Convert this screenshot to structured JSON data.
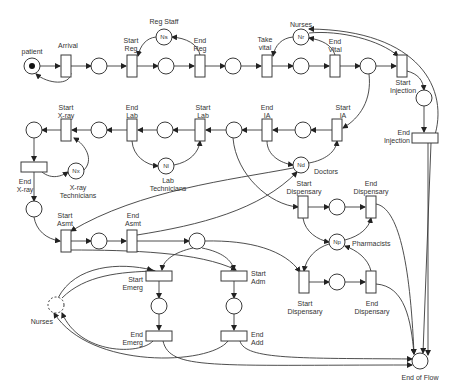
{
  "diagram": {
    "type": "petri-net",
    "places": [
      {
        "id": "patient",
        "label": "patient",
        "x": 32,
        "y": 66,
        "token": true
      },
      {
        "id": "p1",
        "label": "",
        "x": 99,
        "y": 66
      },
      {
        "id": "reg_staff",
        "label": "Reg Staff",
        "inner": "Ns",
        "x": 164,
        "y": 37
      },
      {
        "id": "p2",
        "label": "",
        "x": 166,
        "y": 66
      },
      {
        "id": "p3",
        "label": "",
        "x": 233,
        "y": 66
      },
      {
        "id": "nurses_top",
        "label": "Nurses",
        "inner": "Nr",
        "x": 301,
        "y": 37
      },
      {
        "id": "p4",
        "label": "",
        "x": 301,
        "y": 66
      },
      {
        "id": "p5",
        "label": "",
        "x": 368,
        "y": 66
      },
      {
        "id": "p6",
        "label": "",
        "x": 424,
        "y": 98
      },
      {
        "id": "p_ia",
        "label": "",
        "x": 303,
        "y": 130
      },
      {
        "id": "p_lab1",
        "label": "",
        "x": 234,
        "y": 130
      },
      {
        "id": "p_lab2",
        "label": "",
        "x": 165,
        "y": 130
      },
      {
        "id": "p_x1",
        "label": "",
        "x": 99,
        "y": 130
      },
      {
        "id": "p_x0",
        "label": "",
        "x": 34,
        "y": 130
      },
      {
        "id": "xray_tech",
        "label": "X-ray Technicians",
        "inner": "Nx",
        "x": 76,
        "y": 171
      },
      {
        "id": "lab_tech",
        "label": "Lab Technicians",
        "inner": "Nl",
        "x": 166,
        "y": 166
      },
      {
        "id": "doctors",
        "label": "Doctors",
        "inner": "Nd",
        "x": 301,
        "y": 165
      },
      {
        "id": "p_asm0",
        "label": "",
        "x": 34,
        "y": 209
      },
      {
        "id": "p_asm1",
        "label": "",
        "x": 99,
        "y": 241
      },
      {
        "id": "p_asm2",
        "label": "",
        "x": 197,
        "y": 241
      },
      {
        "id": "p_disp1",
        "label": "",
        "x": 337,
        "y": 207
      },
      {
        "id": "pharmacists",
        "label": "Pharmacists",
        "inner": "Np",
        "x": 337,
        "y": 242
      },
      {
        "id": "p_disp2",
        "label": "",
        "x": 337,
        "y": 282
      },
      {
        "id": "nurses_bottom",
        "label": "Nurses",
        "x": 56,
        "y": 305,
        "dashed": true
      },
      {
        "id": "p_emerg",
        "label": "",
        "x": 159,
        "y": 306
      },
      {
        "id": "p_adm",
        "label": "",
        "x": 234,
        "y": 306
      },
      {
        "id": "end_of_flow",
        "label": "End of Flow",
        "x": 420,
        "y": 361
      }
    ],
    "transitions": [
      {
        "id": "arrival",
        "label": "Arrival",
        "x": 66,
        "y": 66,
        "w": 10,
        "h": 22
      },
      {
        "id": "start_reg",
        "label": "Start\nReg",
        "x": 132,
        "y": 66,
        "w": 10,
        "h": 22
      },
      {
        "id": "end_reg",
        "label": "End\nReg",
        "x": 200,
        "y": 66,
        "w": 10,
        "h": 22
      },
      {
        "id": "take_vital",
        "label": "Take\nvital",
        "x": 267,
        "y": 66,
        "w": 10,
        "h": 22
      },
      {
        "id": "end_vital",
        "label": "End\nVital",
        "x": 335,
        "y": 66,
        "w": 10,
        "h": 22
      },
      {
        "id": "start_injection",
        "label": "Start\nInjection",
        "x": 402,
        "y": 66,
        "w": 10,
        "h": 22
      },
      {
        "id": "end_injection",
        "label": "End\nInjection",
        "x": 425,
        "y": 138,
        "w": 26,
        "h": 10
      },
      {
        "id": "start_ia",
        "label": "Start\nIA",
        "x": 337,
        "y": 130,
        "w": 10,
        "h": 22
      },
      {
        "id": "end_ia",
        "label": "End\nIA",
        "x": 267,
        "y": 130,
        "w": 10,
        "h": 22
      },
      {
        "id": "start_lab",
        "label": "Start\nLab",
        "x": 200,
        "y": 130,
        "w": 10,
        "h": 22
      },
      {
        "id": "end_lab",
        "label": "End\nLab",
        "x": 132,
        "y": 130,
        "w": 10,
        "h": 22
      },
      {
        "id": "start_xray",
        "label": "Start\nX-ray",
        "x": 66,
        "y": 130,
        "w": 10,
        "h": 22
      },
      {
        "id": "end_xray",
        "label": "End\nX-ray",
        "x": 34,
        "y": 167,
        "w": 26,
        "h": 10
      },
      {
        "id": "start_asmt",
        "label": "Start\nAsmt",
        "x": 66,
        "y": 241,
        "w": 10,
        "h": 22
      },
      {
        "id": "end_asmt",
        "label": "End\nAsmt",
        "x": 132,
        "y": 241,
        "w": 10,
        "h": 22
      },
      {
        "id": "start_disp_top",
        "label": "Start\nDispensary",
        "x": 303,
        "y": 207,
        "w": 10,
        "h": 22
      },
      {
        "id": "end_disp_top",
        "label": "End\nDispensary",
        "x": 371,
        "y": 207,
        "w": 10,
        "h": 22
      },
      {
        "id": "start_emerg",
        "label": "Start\nEmerg",
        "x": 159,
        "y": 276,
        "w": 26,
        "h": 10
      },
      {
        "id": "start_adm",
        "label": "Start\nAdm",
        "x": 234,
        "y": 276,
        "w": 26,
        "h": 10
      },
      {
        "id": "start_disp_bottom",
        "label": "Start\nDispensary",
        "x": 304,
        "y": 282,
        "w": 10,
        "h": 22
      },
      {
        "id": "end_disp_bottom",
        "label": "End\nDispensary",
        "x": 371,
        "y": 282,
        "w": 10,
        "h": 22
      },
      {
        "id": "end_emerg",
        "label": "End\nEmerg",
        "x": 159,
        "y": 336,
        "w": 26,
        "h": 10
      },
      {
        "id": "end_add",
        "label": "End\nAdd",
        "x": 234,
        "y": 336,
        "w": 26,
        "h": 10
      }
    ],
    "labels": {
      "patient": "patient",
      "arrival": "Arrival",
      "reg_staff": "Reg Staff",
      "reg_staff_token": "Ns",
      "start_reg": "Start\nReg",
      "end_reg": "End\nReg",
      "nurses_top": "Nurses",
      "nurses_top_token": "Nr",
      "take_vital": "Take\nvital",
      "end_vital": "End\nVital",
      "start_injection": "Start\nInjection",
      "end_injection": "End\nInjection",
      "start_ia": "Start\nIA",
      "end_ia": "End\nIA",
      "start_lab": "Start\nLab",
      "end_lab": "End\nLab",
      "start_xray": "Start\nX-ray",
      "end_xray": "End\nX-ray",
      "xray_tech": "X-ray\nTechnicians",
      "xray_tech_token": "Nx",
      "lab_tech": "Lab\nTechnicians",
      "lab_tech_token": "Nl",
      "doctors": "Doctors",
      "doctors_token": "Nd",
      "start_asmt": "Start\nAsmt",
      "end_asmt": "End\nAsmt",
      "start_disp_top": "Start\nDispensary",
      "end_disp_top": "End\nDispensary",
      "pharmacists": "Pharmacists",
      "pharmacists_token": "Np",
      "start_disp_bottom": "Start\nDispensary",
      "end_disp_bottom": "End\nDispensary",
      "start_emerg": "Start\nEmerg",
      "end_emerg": "End\nEmerg",
      "start_adm": "Start\nAdm",
      "end_add": "End\nAdd",
      "nurses_bottom": "Nurses",
      "end_of_flow": "End of Flow"
    }
  }
}
